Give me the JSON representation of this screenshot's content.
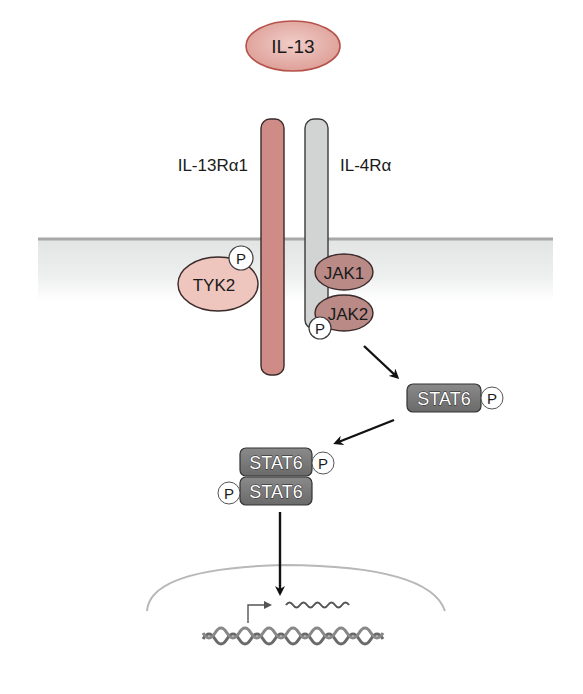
{
  "ligand": {
    "label": "IL-13",
    "fill": "#e3aaa2",
    "stroke": "#b5524a"
  },
  "receptors": [
    {
      "id": "il13ra1",
      "label": "IL-13Rα1",
      "fill": "#cf8c86",
      "stroke": "#3a2a2a"
    },
    {
      "id": "il4ra",
      "label": "IL-4Rα",
      "fill": "#d2d4d4",
      "stroke": "#3a3a3a"
    }
  ],
  "kinases": [
    {
      "id": "tyk2",
      "label": "TYK2",
      "fill": "#efc6be",
      "phosphorylated": true
    },
    {
      "id": "jak1",
      "label": "JAK1",
      "fill": "#b98a86",
      "phosphorylated": false
    },
    {
      "id": "jak2",
      "label": "JAK2",
      "fill": "#b98a86",
      "phosphorylated": true
    }
  ],
  "phospho_label": "P",
  "stat": {
    "monomer": {
      "label": "STAT6",
      "phospho": "P"
    },
    "dimer": [
      {
        "label": "STAT6",
        "phospho": "P",
        "phospho_side": "right"
      },
      {
        "label": "STAT6",
        "phospho": "P",
        "phospho_side": "left"
      }
    ],
    "fill": "#7a7a7a"
  },
  "membrane": {
    "line_color": "#a8a8a8",
    "fill_top": "#e6e7e7"
  },
  "nucleus": {
    "outline_color": "#b8b8b8",
    "dna_color": "#6a6a6a",
    "mrna_color": "#555555"
  }
}
